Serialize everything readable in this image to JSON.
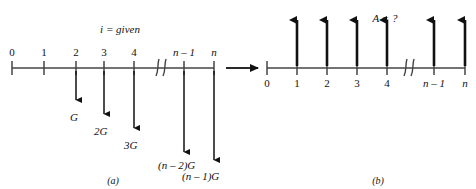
{
  "figure": {
    "title_a_annotation": "i = given",
    "title_b_annotation": "A = ?",
    "caption_a": "(a)",
    "caption_b": "(b)",
    "transition_arrow": "right-arrow",
    "line_color": "#444444",
    "arrow_color": "#111111",
    "text_color": "#111111"
  },
  "diagram_a": {
    "name": "gradient-cash-flow-diagram",
    "axis": {
      "x_start": 12,
      "x_end": 214,
      "y": 68
    },
    "break_symbol": "//",
    "break_x": 160,
    "ticks": [
      {
        "label": "0",
        "x": 12,
        "italic": false
      },
      {
        "label": "1",
        "x": 44,
        "italic": false
      },
      {
        "label": "2",
        "x": 76,
        "italic": false
      },
      {
        "label": "3",
        "x": 104,
        "italic": false
      },
      {
        "label": "4",
        "x": 134,
        "italic": false
      },
      {
        "label": "n – 1",
        "x": 184,
        "italic": true
      },
      {
        "label": "n",
        "x": 214,
        "italic": true
      }
    ],
    "flows": [
      {
        "tick": "2",
        "x": 76,
        "length": 32,
        "label": "G",
        "label_x": 70,
        "label_y": 112
      },
      {
        "tick": "3",
        "x": 104,
        "length": 46,
        "label": "2G",
        "label_x": 94,
        "label_y": 126
      },
      {
        "tick": "4",
        "x": 134,
        "length": 60,
        "label": "3G",
        "label_x": 124,
        "label_y": 140
      },
      {
        "tick": "n - 1",
        "x": 184,
        "length": 84,
        "label": "(n – 2)G",
        "label_x": 158,
        "label_y": 160
      },
      {
        "tick": "n",
        "x": 214,
        "length": 92,
        "label": "(n – 1)G",
        "label_x": 182,
        "label_y": 171
      }
    ]
  },
  "diagram_b": {
    "name": "uniform-series-cash-flow-diagram",
    "axis": {
      "x_start": 267,
      "x_end": 465,
      "y": 68
    },
    "break_symbol": "//",
    "break_x": 408,
    "ticks": [
      {
        "label": "0",
        "x": 267,
        "italic": false
      },
      {
        "label": "1",
        "x": 297,
        "italic": false
      },
      {
        "label": "2",
        "x": 327,
        "italic": false
      },
      {
        "label": "3",
        "x": 357,
        "italic": false
      },
      {
        "label": "4",
        "x": 387,
        "italic": false
      },
      {
        "label": "n – 1",
        "x": 434,
        "italic": true
      },
      {
        "label": "n",
        "x": 465,
        "italic": true
      }
    ],
    "flows": [
      {
        "tick": "1",
        "x": 297,
        "length": 48
      },
      {
        "tick": "2",
        "x": 327,
        "length": 48
      },
      {
        "tick": "3",
        "x": 357,
        "length": 48
      },
      {
        "tick": "4",
        "x": 387,
        "length": 48
      },
      {
        "tick": "n - 1",
        "x": 434,
        "length": 48
      },
      {
        "tick": "n",
        "x": 465,
        "length": 48
      }
    ]
  },
  "annotations": {
    "i_given_x": 120,
    "i_given_y": 24,
    "a_unknown_x": 385,
    "a_unknown_y": 13,
    "caption_a_x": 113,
    "caption_a_y": 176,
    "caption_b_x": 378,
    "caption_b_y": 176
  }
}
